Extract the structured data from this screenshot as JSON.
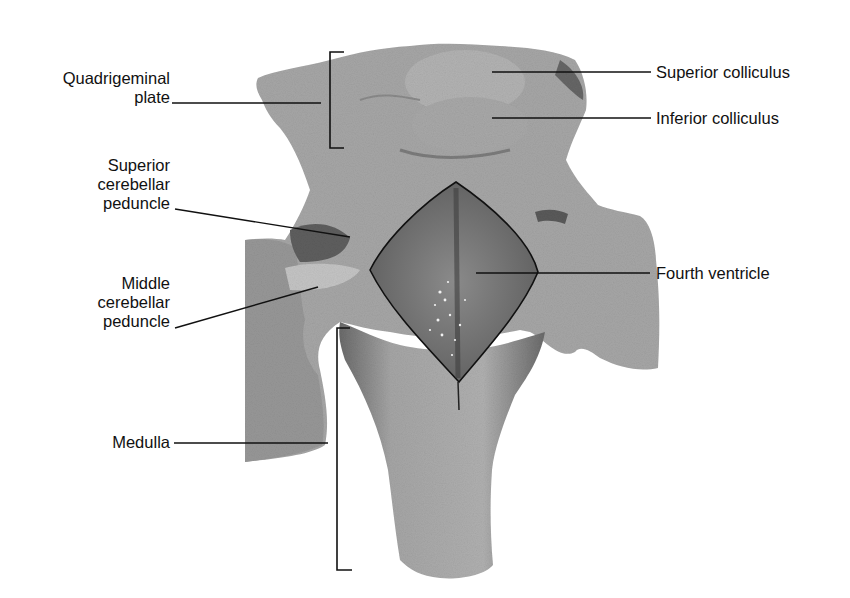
{
  "figure": {
    "colors": {
      "background": "#ffffff",
      "tissue": "#a9a9a9",
      "tissue_dark": "#6e6e6e",
      "ventricle": "#777777",
      "line": "#111111"
    },
    "labels_left": [
      {
        "id": "quadrigeminal-plate",
        "lines": [
          "Quadrigeminal",
          "plate"
        ]
      },
      {
        "id": "superior-cerebellar-peduncle",
        "lines": [
          "Superior",
          "cerebellar",
          "peduncle"
        ]
      },
      {
        "id": "middle-cerebellar-peduncle",
        "lines": [
          "Middle",
          "cerebellar",
          "peduncle"
        ]
      },
      {
        "id": "medulla",
        "lines": [
          "Medulla"
        ]
      }
    ],
    "labels_right": [
      {
        "id": "superior-colliculus",
        "lines": [
          "Superior colliculus"
        ]
      },
      {
        "id": "inferior-colliculus",
        "lines": [
          "Inferior colliculus"
        ]
      },
      {
        "id": "fourth-ventricle",
        "lines": [
          "Fourth ventricle"
        ]
      }
    ]
  }
}
